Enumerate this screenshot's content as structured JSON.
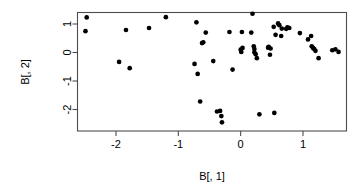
{
  "chart_data": {
    "type": "scatter",
    "title": "",
    "subtitle": "",
    "xlabel": "B[, 1]",
    "ylabel": "B[, 2]",
    "xlim": [
      -2.66,
      1.71
    ],
    "ylim": [
      -2.55,
      1.43
    ],
    "grid": false,
    "legend": null,
    "xticks": [
      -2,
      -1,
      0,
      1
    ],
    "xtick_labels": [
      "-2",
      "-1",
      "0",
      "1"
    ],
    "yticks": [
      1,
      0,
      -1,
      -2
    ],
    "ytick_labels": [
      "1",
      "0",
      "-1",
      "-2"
    ],
    "marker": "filled-circle",
    "marker_color": "#000000",
    "marker_size": 3.4,
    "n_points": 58,
    "points": [
      [
        -2.47,
        1.23
      ],
      [
        -2.49,
        0.75
      ],
      [
        -1.84,
        0.79
      ],
      [
        -1.95,
        -0.33
      ],
      [
        -1.78,
        -0.55
      ],
      [
        -1.47,
        0.86
      ],
      [
        -1.2,
        1.24
      ],
      [
        -0.71,
        1.06
      ],
      [
        -0.74,
        -0.4
      ],
      [
        -0.69,
        -0.75
      ],
      [
        -0.65,
        -1.72
      ],
      [
        -0.56,
        0.7
      ],
      [
        -0.6,
        0.36
      ],
      [
        -0.44,
        -0.3
      ],
      [
        -0.38,
        -2.07
      ],
      [
        -0.33,
        -2.05
      ],
      [
        -0.31,
        -2.23
      ],
      [
        -0.3,
        -2.45
      ],
      [
        -0.18,
        0.72
      ],
      [
        -0.13,
        -0.6
      ],
      [
        0.02,
        0.72
      ],
      [
        0.0,
        0.1
      ],
      [
        0.01,
        0.02
      ],
      [
        0.03,
        0.16
      ],
      [
        0.19,
        1.36
      ],
      [
        0.17,
        0.7
      ],
      [
        0.22,
        0.12
      ],
      [
        0.22,
        0.01
      ],
      [
        0.24,
        -0.06
      ],
      [
        0.26,
        -0.2
      ],
      [
        0.3,
        -2.17
      ],
      [
        0.44,
        0.17
      ],
      [
        0.48,
        0.14
      ],
      [
        0.47,
        -0.08
      ],
      [
        0.54,
        -2.12
      ],
      [
        0.56,
        0.62
      ],
      [
        0.6,
        1.02
      ],
      [
        0.62,
        0.96
      ],
      [
        0.66,
        0.84
      ],
      [
        0.75,
        0.88
      ],
      [
        0.78,
        0.86
      ],
      [
        0.73,
        0.83
      ],
      [
        0.95,
        0.68
      ],
      [
        1.08,
        0.46
      ],
      [
        1.13,
        0.58
      ],
      [
        1.16,
        0.16
      ],
      [
        1.18,
        0.12
      ],
      [
        1.2,
        0.06
      ],
      [
        1.25,
        -0.2
      ],
      [
        1.47,
        0.08
      ],
      [
        1.52,
        0.11
      ],
      [
        1.57,
        0.02
      ],
      [
        0.53,
        0.9
      ],
      [
        0.65,
        0.58
      ],
      [
        -0.62,
        0.33
      ],
      [
        0.21,
        0.22
      ],
      [
        0.45,
        0.2
      ],
      [
        1.14,
        0.22
      ]
    ]
  }
}
